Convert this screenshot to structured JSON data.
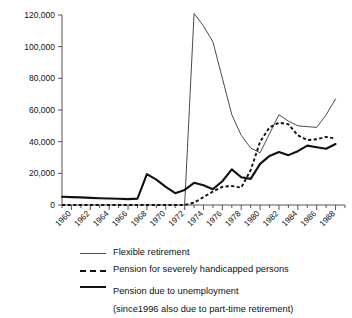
{
  "chart_data": {
    "type": "line",
    "title": "",
    "subtitle": "",
    "xlabel": "",
    "ylabel": "",
    "xlim": [
      1959,
      1989
    ],
    "ylim": [
      0,
      120000
    ],
    "grid": false,
    "legend_position": "bottom",
    "y_ticks": [
      0,
      20000,
      40000,
      60000,
      80000,
      100000,
      120000
    ],
    "y_tick_labels": [
      "0",
      "20,000",
      "40,000",
      "60,000",
      "80,000",
      "100,000",
      "120,000"
    ],
    "x_ticks": [
      1960,
      1962,
      1964,
      1966,
      1968,
      1970,
      1972,
      1974,
      1976,
      1978,
      1980,
      1982,
      1984,
      1986,
      1988
    ],
    "x_tick_labels": [
      "1960",
      "1962",
      "1964",
      "1966",
      "1968",
      "1970",
      "1972",
      "1974",
      "1976",
      "1978",
      "1980",
      "1982",
      "1984",
      "1986",
      "1988"
    ],
    "x_minor_ticks": [
      1959,
      1961,
      1963,
      1965,
      1967,
      1969,
      1971,
      1973,
      1975,
      1977,
      1979,
      1981,
      1983,
      1985,
      1987,
      1989
    ],
    "x": [
      1959,
      1960,
      1961,
      1962,
      1963,
      1964,
      1965,
      1966,
      1967,
      1968,
      1969,
      1970,
      1971,
      1972,
      1973,
      1974,
      1975,
      1976,
      1977,
      1978,
      1979,
      1980,
      1981,
      1982,
      1983,
      1984,
      1985,
      1986,
      1987,
      1988
    ],
    "series": [
      {
        "name": "Flexible retirement",
        "style": "thin-solid",
        "color": "#4a4a4a",
        "values": [
          null,
          null,
          null,
          null,
          null,
          null,
          null,
          null,
          null,
          null,
          null,
          null,
          null,
          0,
          121000,
          113000,
          103000,
          80000,
          57000,
          44000,
          36000,
          33000,
          45000,
          57000,
          53000,
          50000,
          49500,
          49000,
          57000,
          67000
        ]
      },
      {
        "name": "Pension for severely handicapped persons",
        "style": "dashed",
        "color": "#111111",
        "values": [
          0,
          0,
          0,
          0,
          0,
          0,
          0,
          0,
          0,
          0,
          0,
          0,
          0,
          0,
          1500,
          5000,
          8500,
          11500,
          12000,
          11000,
          22000,
          40000,
          49000,
          52000,
          51000,
          44000,
          41000,
          41500,
          43000,
          42000
        ]
      },
      {
        "name": "Pension due to unemployment (since1996 also due to part-time retirement)",
        "style": "thick-solid",
        "color": "#111111",
        "values": [
          5200,
          5000,
          4800,
          4500,
          4300,
          4100,
          3900,
          3700,
          4000,
          19500,
          16000,
          11500,
          7500,
          9500,
          14000,
          12500,
          10000,
          15000,
          22500,
          17500,
          16500,
          26000,
          31000,
          33500,
          31500,
          34000,
          37500,
          36500,
          35500,
          38500
        ]
      }
    ]
  },
  "legend": {
    "items": [
      {
        "label": "Flexible retirement",
        "sub": "",
        "swatch": "thin-solid-line-icon"
      },
      {
        "label": "Pension for severely handicapped persons",
        "sub": "",
        "swatch": "dashed-line-icon"
      },
      {
        "label": "Pension due to unemployment",
        "sub": "(since1996 also due to part-time retirement)",
        "swatch": "thick-solid-line-icon"
      }
    ]
  }
}
